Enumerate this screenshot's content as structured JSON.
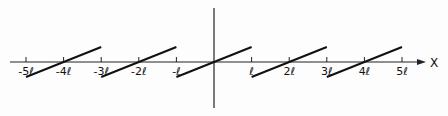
{
  "diagram": {
    "x_axis_label": "X",
    "tick_labels": [
      "-5ℓ",
      "-4ℓ",
      "-3ℓ",
      "-2ℓ",
      "-ℓ",
      "ℓ",
      "2ℓ",
      "3ℓ",
      "4ℓ",
      "5ℓ"
    ],
    "tick_values": [
      -5,
      -4,
      -3,
      -2,
      -1,
      1,
      2,
      3,
      4,
      5
    ],
    "segments": [
      {
        "from": -5,
        "to": -3,
        "center": -4
      },
      {
        "from": -3,
        "to": -1,
        "center": -2
      },
      {
        "from": -1,
        "to": 1,
        "center": 0
      },
      {
        "from": 1,
        "to": 3,
        "center": 2
      },
      {
        "from": 3,
        "to": 5,
        "center": 4
      }
    ],
    "colors": {
      "line": "#111111",
      "axis": "#222222",
      "background": "#fdfdfd"
    }
  }
}
